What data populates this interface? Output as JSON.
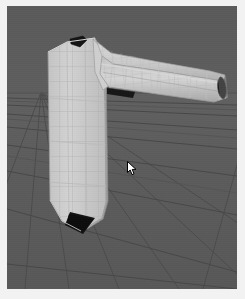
{
  "app": {
    "name": "3d-modeling-viewport",
    "title": "3D Viewport",
    "shading_mode": "Solid + Wireframe"
  },
  "viewport": {
    "label": "perspective-viewport",
    "background_color": "#5c5c5c",
    "ground_color": "#5b5b5b",
    "grid_line_color": "#4a4a4a",
    "frame_color": "#f2f2f2",
    "x": 7,
    "y": 6,
    "width": 230,
    "height": 283
  },
  "grid": {
    "visible": true,
    "type": "perspective-floor-grid",
    "horizon_y": 90,
    "vanishing_point_x": 34,
    "vanishing_point_y": 86,
    "major_line_color": "#474747",
    "minor_line_color": "#505050",
    "rows": 9,
    "columns": 10
  },
  "model": {
    "name": "pipe-elbow-mesh",
    "display": "wireframe-shaded",
    "surface_color": "#c9c9c9",
    "surface_shadow_color": "#a9a9a9",
    "surface_highlight_color": "#dcdcdc",
    "wire_color": "#b2b2b2",
    "opening_color": "#151515",
    "parts": [
      {
        "name": "vertical-shaft",
        "description": "tapered vertical column on the left"
      },
      {
        "name": "elbow-joint",
        "description": "rounded bend connecting shaft to horizontal tube"
      },
      {
        "name": "horizontal-tube",
        "description": "tapered tube extending to the right edge"
      },
      {
        "name": "top-opening",
        "description": "dark hole at top of the vertical shaft"
      },
      {
        "name": "bottom-opening",
        "description": "dark hole at the base of the vertical shaft"
      },
      {
        "name": "tube-end-opening",
        "description": "dark elliptical opening at the far right tube end"
      },
      {
        "name": "elbow-underside-opening",
        "description": "dark sliver beneath the elbow joint"
      }
    ]
  },
  "cursor": {
    "name": "mouse-pointer",
    "x": 127,
    "y": 161,
    "color": "#ffffff",
    "outline_color": "#000000"
  }
}
